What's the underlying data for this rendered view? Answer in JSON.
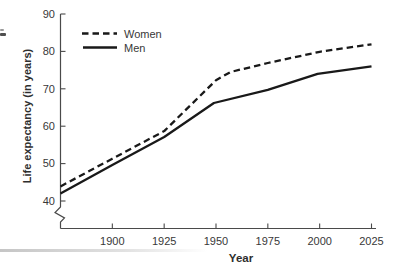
{
  "colors": {
    "line": "#191919",
    "axis": "#4a4a4a",
    "text": "#383838"
  },
  "chart_data": {
    "type": "line",
    "title": "",
    "xlabel": "Year",
    "ylabel": "Life expectancy (in years)",
    "xlim": [
      1875,
      2025
    ],
    "ylim": [
      40,
      90
    ],
    "x_ticks": [
      1900,
      1925,
      1950,
      1975,
      2000,
      2025
    ],
    "y_ticks": [
      40,
      50,
      60,
      70,
      80,
      90
    ],
    "y_axis_break_below": 40,
    "grid": false,
    "legend_position": "top-left-inside",
    "legend": [
      "Women",
      "Men"
    ],
    "series": [
      {
        "name": "Women",
        "style": "dashed",
        "points": [
          [
            1875,
            43.9
          ],
          [
            1900,
            51.3
          ],
          [
            1925,
            58.7
          ],
          [
            1950,
            72.3
          ],
          [
            1957,
            74.5
          ],
          [
            1975,
            76.9
          ],
          [
            2000,
            79.9
          ],
          [
            2025,
            81.9
          ]
        ]
      },
      {
        "name": "Men",
        "style": "solid",
        "points": [
          [
            1875,
            42.0
          ],
          [
            1900,
            49.6
          ],
          [
            1925,
            57.1
          ],
          [
            1949,
            66.2
          ],
          [
            1975,
            69.7
          ],
          [
            1999,
            74.0
          ],
          [
            2025,
            76.0
          ]
        ]
      }
    ]
  }
}
